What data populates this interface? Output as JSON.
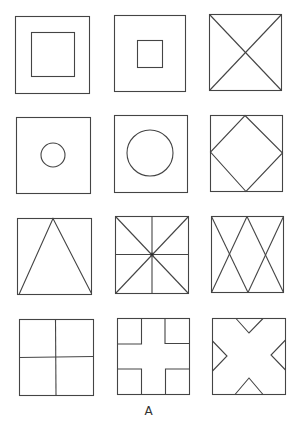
{
  "figure": {
    "label": "A",
    "stroke_color": "#444444",
    "background": "#ffffff"
  },
  "panels": [
    {
      "row": 1,
      "col": 1,
      "name": "square-in-square-large",
      "description": "Square with large inner square"
    },
    {
      "row": 1,
      "col": 2,
      "name": "square-in-square-small",
      "description": "Square with small inner square"
    },
    {
      "row": 1,
      "col": 3,
      "name": "square-with-diagonals",
      "description": "Square with both diagonals (X)"
    },
    {
      "row": 2,
      "col": 1,
      "name": "square-small-circle",
      "description": "Square with small centered circle"
    },
    {
      "row": 2,
      "col": 2,
      "name": "square-large-circle",
      "description": "Square with large centered circle"
    },
    {
      "row": 2,
      "col": 3,
      "name": "square-inscribed-diamond",
      "description": "Square with inscribed diamond"
    },
    {
      "row": 3,
      "col": 1,
      "name": "square-triangle",
      "description": "Square with inscribed triangle, apex at top center"
    },
    {
      "row": 3,
      "col": 2,
      "name": "square-star-lines",
      "description": "Square with diagonals and midlines"
    },
    {
      "row": 3,
      "col": 3,
      "name": "square-double-x",
      "description": "Square with two crossing X patterns"
    },
    {
      "row": 4,
      "col": 1,
      "name": "square-quadrants",
      "description": "Square divided into four quadrants"
    },
    {
      "row": 4,
      "col": 2,
      "name": "square-cross-corners",
      "description": "Square with four corner squares forming a cross"
    },
    {
      "row": 4,
      "col": 3,
      "name": "square-triangular-notches",
      "description": "Square with triangular notches on each side forming an X"
    }
  ]
}
